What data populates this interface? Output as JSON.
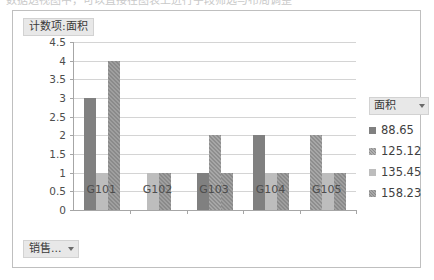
{
  "top_strip": {
    "ghost_text": "数据透视图中，可以直接在图表上进行字段筛选与布局调整"
  },
  "chart": {
    "title": "计数项:面积",
    "bottom_field_button": {
      "label": "销售...",
      "caret_icon": "chevron-down-icon"
    },
    "legend": {
      "header_label": "面积",
      "header_caret_icon": "chevron-down-icon"
    }
  },
  "chart_data": {
    "type": "bar",
    "title": "计数项:面积",
    "xlabel": "",
    "ylabel": "",
    "categories": [
      "G101",
      "G102",
      "G103",
      "G104",
      "G105"
    ],
    "ylim": [
      0,
      4.5
    ],
    "ytick_labels": [
      "0",
      "0.5",
      "1",
      "1.5",
      "2",
      "2.5",
      "3",
      "3.5",
      "4",
      "4.5"
    ],
    "ytick_values": [
      0,
      0.5,
      1,
      1.5,
      2,
      2.5,
      3,
      3.5,
      4,
      4.5
    ],
    "grid": true,
    "legend_position": "right",
    "legend_title": "面积",
    "series": [
      {
        "name": "88.65",
        "values": [
          3,
          0,
          1,
          2,
          0
        ]
      },
      {
        "name": "125.12",
        "values": [
          0,
          0,
          2,
          0,
          2
        ]
      },
      {
        "name": "135.45",
        "values": [
          1,
          1,
          0,
          1,
          1
        ]
      },
      {
        "name": "158.23",
        "values": [
          4,
          1,
          1,
          1,
          1
        ]
      }
    ]
  }
}
